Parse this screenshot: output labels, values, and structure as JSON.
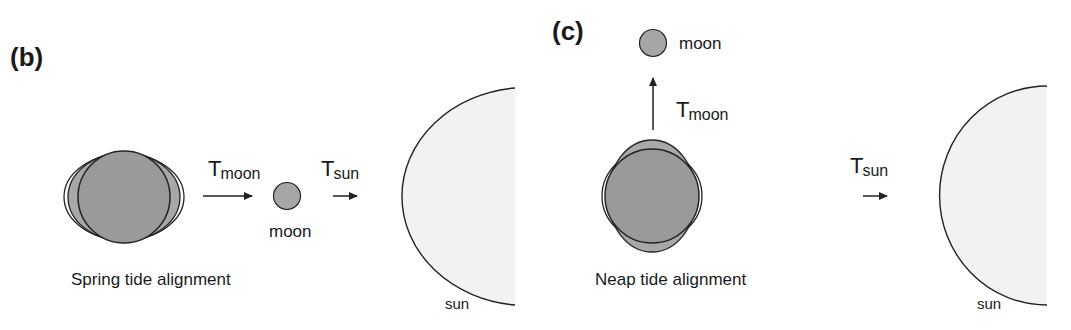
{
  "panels": {
    "b": {
      "label": "(b)",
      "caption": "Spring tide alignment",
      "moon_label": "moon",
      "sun_label": "sun",
      "force_moon": {
        "symbol": "T",
        "subscript": "moon"
      },
      "force_sun": {
        "symbol": "T",
        "subscript": "sun"
      }
    },
    "c": {
      "label": "(c)",
      "caption": "Neap tide alignment",
      "moon_label": "moon",
      "sun_label": "sun",
      "force_moon": {
        "symbol": "T",
        "subscript": "moon"
      },
      "force_sun": {
        "symbol": "T",
        "subscript": "sun"
      }
    }
  },
  "colors": {
    "earth": "#9a9a9a",
    "bulge": "#a8a8a8",
    "moon": "#a6a6a6",
    "sun": "#f2f2f2",
    "stroke": "#222222"
  }
}
